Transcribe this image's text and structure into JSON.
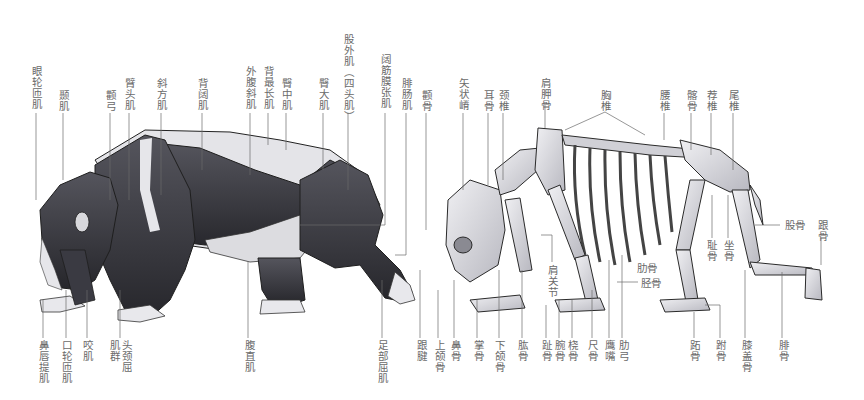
{
  "figure": {
    "left_panel": "musculature",
    "right_panel": "skeleton",
    "colors": {
      "background": "#ffffff",
      "label_text": "#6a6a6a",
      "leader_line": "#555555",
      "muscle_dark": "#2e2e33",
      "muscle_mid": "#4a4a52",
      "bone_light": "#e2e2e6",
      "bone_shade": "#9a9aa2",
      "outline": "#1e1e1e"
    }
  },
  "muscle_labels_top": [
    {
      "id": "m1",
      "text": "眼轮匝肌",
      "x": 30,
      "y": 66
    },
    {
      "id": "m2",
      "text": "颞肌",
      "x": 57,
      "y": 90
    },
    {
      "id": "m3",
      "text": "颧弓",
      "x": 104,
      "y": 90
    },
    {
      "id": "m4",
      "text": "臂头肌",
      "x": 123,
      "y": 78
    },
    {
      "id": "m5",
      "text": "斜方肌",
      "x": 155,
      "y": 78
    },
    {
      "id": "m6",
      "text": "背阔肌",
      "x": 196,
      "y": 78
    },
    {
      "id": "m7",
      "text": "外腹斜肌",
      "x": 244,
      "y": 66
    },
    {
      "id": "m8",
      "text": "背最长肌",
      "x": 262,
      "y": 66
    },
    {
      "id": "m9",
      "text": "臀中肌",
      "x": 280,
      "y": 78
    },
    {
      "id": "m10",
      "text": "臀大肌",
      "x": 317,
      "y": 78
    },
    {
      "id": "m11",
      "text": "股外肌（四头肌）",
      "x": 342,
      "y": 34
    },
    {
      "id": "m12",
      "text": "阔筋膜张肌",
      "x": 379,
      "y": 54
    },
    {
      "id": "m13",
      "text": "腓肠肌",
      "x": 400,
      "y": 78
    }
  ],
  "muscle_labels_bottom": [
    {
      "id": "mb1",
      "text": "鼻唇提肌",
      "x": 37,
      "y": 340
    },
    {
      "id": "mb2",
      "text": "口轮匝肌",
      "x": 60,
      "y": 340
    },
    {
      "id": "mb3",
      "text": "咬肌",
      "x": 81,
      "y": 340
    },
    {
      "id": "mb4",
      "text": "肌群",
      "x": 108,
      "y": 340
    },
    {
      "id": "mb5",
      "text": "头颈屈",
      "x": 120,
      "y": 340
    },
    {
      "id": "mb6",
      "text": "腹直肌",
      "x": 243,
      "y": 340
    },
    {
      "id": "mb7",
      "text": "足部屈肌",
      "x": 376,
      "y": 340
    }
  ],
  "bone_labels_top": [
    {
      "id": "b1",
      "text": "颧骨",
      "x": 420,
      "y": 90
    },
    {
      "id": "b2",
      "text": "矢状嵴",
      "x": 457,
      "y": 78
    },
    {
      "id": "b3",
      "text": "耳骨",
      "x": 482,
      "y": 90
    },
    {
      "id": "b4",
      "text": "颈椎",
      "x": 497,
      "y": 90
    },
    {
      "id": "b5",
      "text": "肩胛骨",
      "x": 539,
      "y": 78
    },
    {
      "id": "b6",
      "text": "胸椎",
      "x": 599,
      "y": 90
    },
    {
      "id": "b7",
      "text": "腰椎",
      "x": 658,
      "y": 90
    },
    {
      "id": "b8",
      "text": "髂骨",
      "x": 685,
      "y": 90
    },
    {
      "id": "b9",
      "text": "荐椎",
      "x": 705,
      "y": 90
    },
    {
      "id": "b10",
      "text": "尾椎",
      "x": 727,
      "y": 90
    }
  ],
  "bone_labels_side": [
    {
      "id": "bs1",
      "text": "耻骨",
      "x": 705,
      "y": 240,
      "vertical": true
    },
    {
      "id": "bs2",
      "text": "坐骨",
      "x": 722,
      "y": 240,
      "vertical": true
    },
    {
      "id": "bs3",
      "text": "股骨",
      "x": 785,
      "y": 220,
      "vertical": false
    },
    {
      "id": "bs4",
      "text": "跟骨",
      "x": 816,
      "y": 220,
      "vertical": true
    },
    {
      "id": "bs5",
      "text": "肋骨",
      "x": 637,
      "y": 264,
      "vertical": false
    },
    {
      "id": "bs6",
      "text": "胫骨",
      "x": 641,
      "y": 280,
      "vertical": false
    },
    {
      "id": "bs7",
      "text": "肩关节",
      "x": 546,
      "y": 265,
      "vertical": true
    }
  ],
  "bone_labels_bottom": [
    {
      "id": "bb1",
      "text": "跟腱",
      "x": 415,
      "y": 340
    },
    {
      "id": "bb2",
      "text": "上颌骨",
      "x": 433,
      "y": 340
    },
    {
      "id": "bb3",
      "text": "鼻骨",
      "x": 449,
      "y": 340
    },
    {
      "id": "bb4",
      "text": "掌骨",
      "x": 472,
      "y": 340
    },
    {
      "id": "bb5",
      "text": "下颌骨",
      "x": 493,
      "y": 340
    },
    {
      "id": "bb6",
      "text": "肱骨",
      "x": 516,
      "y": 340
    },
    {
      "id": "bb7",
      "text": "趾骨",
      "x": 540,
      "y": 340
    },
    {
      "id": "bb8",
      "text": "腕骨",
      "x": 553,
      "y": 340
    },
    {
      "id": "bb9",
      "text": "桡骨",
      "x": 566,
      "y": 340
    },
    {
      "id": "bb10",
      "text": "尺骨",
      "x": 586,
      "y": 340
    },
    {
      "id": "bb11",
      "text": "鹰嘴",
      "x": 603,
      "y": 340
    },
    {
      "id": "bb12",
      "text": "肋弓",
      "x": 617,
      "y": 340
    },
    {
      "id": "bb13",
      "text": "跖骨",
      "x": 688,
      "y": 340
    },
    {
      "id": "bb14",
      "text": "跗骨",
      "x": 714,
      "y": 340
    },
    {
      "id": "bb15",
      "text": "膝盖骨",
      "x": 740,
      "y": 340
    },
    {
      "id": "bb16",
      "text": "腓骨",
      "x": 777,
      "y": 340
    }
  ]
}
